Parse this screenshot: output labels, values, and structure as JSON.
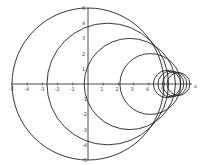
{
  "diagram": {
    "type": "circle family on cartesian axes",
    "x_ticks": [
      "-5",
      "-4",
      "-3",
      "-2",
      "-1",
      "1",
      "2",
      "3",
      "4",
      "5"
    ],
    "y_ticks": [
      "5",
      "4",
      "3",
      "2",
      "1",
      "-1",
      "-2",
      "-3",
      "-4",
      "-5"
    ],
    "x_axis_label": "x",
    "circles": [
      {
        "cx": 0,
        "r": 5
      },
      {
        "cx": 1.3,
        "r": 4
      },
      {
        "cx": 2.75,
        "r": 3
      },
      {
        "cx": 4.1,
        "r": 2
      },
      {
        "cx": 5.2,
        "r": 0.9
      },
      {
        "cx": 5.45,
        "r": 0.85
      },
      {
        "cx": 5.7,
        "r": 0.8
      },
      {
        "cx": 5.95,
        "r": 0.75
      }
    ]
  }
}
